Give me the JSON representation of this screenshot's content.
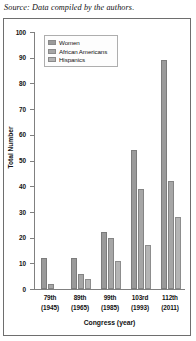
{
  "source_note": "Source: Data compiled by the authors.",
  "chart_data": {
    "type": "bar",
    "title": "",
    "xlabel": "Congress (year)",
    "ylabel": "Total Number",
    "ylim": [
      0,
      100
    ],
    "yticks": [
      0,
      10,
      20,
      30,
      40,
      50,
      60,
      70,
      80,
      90,
      100
    ],
    "grid": false,
    "legend_position": "top-left",
    "categories": [
      "79th\n(1945)",
      "89th\n(1965)",
      "99th\n(1985)",
      "103rd\n(1993)",
      "112th\n(2011)"
    ],
    "category_labels": [
      {
        "congress": "79th",
        "year": "(1945)"
      },
      {
        "congress": "89th",
        "year": "(1965)"
      },
      {
        "congress": "99th",
        "year": "(1985)"
      },
      {
        "congress": "103rd",
        "year": "(1993)"
      },
      {
        "congress": "112th",
        "year": "(2011)"
      }
    ],
    "series": [
      {
        "name": "Women",
        "color": "#9a9a9a",
        "values": [
          12,
          12,
          22,
          54,
          89
        ]
      },
      {
        "name": "African Americans",
        "color": "#a6a6a6",
        "values": [
          2,
          6,
          20,
          39,
          42
        ]
      },
      {
        "name": "Hispanics",
        "color": "#b4b4b4",
        "values": [
          0,
          4,
          11,
          17,
          28
        ]
      }
    ]
  }
}
